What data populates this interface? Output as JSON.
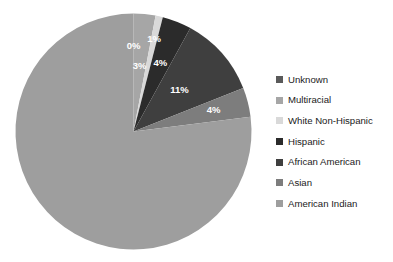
{
  "chart_data": {
    "type": "pie",
    "title": "",
    "categories": [
      "Unknown",
      "Multiracial",
      "White Non-Hispanic",
      "Hispanic",
      "African American",
      "Asian",
      "American Indian"
    ],
    "values": [
      0,
      3,
      1,
      4,
      11,
      4,
      77
    ],
    "value_labels": [
      "0%",
      "3%",
      "1%",
      "4%",
      "11%",
      "4%",
      ""
    ],
    "colors": [
      "#5a5a5a",
      "#a6a6a6",
      "#d9d9d9",
      "#2b2b2b",
      "#3f3f3f",
      "#7d7d7d",
      "#9e9e9e"
    ],
    "legend_position": "right",
    "grid": false,
    "xlabel": "",
    "ylabel": "",
    "background": "#ffffff",
    "label_color": "#ffffff"
  },
  "legend": {
    "items": [
      {
        "label": "Unknown",
        "color": "#5a5a5a"
      },
      {
        "label": "Multiracial",
        "color": "#a6a6a6"
      },
      {
        "label": "White Non-Hispanic",
        "color": "#d9d9d9"
      },
      {
        "label": "Hispanic",
        "color": "#2b2b2b"
      },
      {
        "label": "African American",
        "color": "#3f3f3f"
      },
      {
        "label": "Asian",
        "color": "#7d7d7d"
      },
      {
        "label": "American Indian",
        "color": "#9e9e9e"
      }
    ]
  },
  "slice_labels": {
    "unknown": "0%",
    "multiracial": "3%",
    "white_non_hispanic": "1%",
    "hispanic": "4%",
    "african_american": "11%",
    "asian": "4%"
  }
}
